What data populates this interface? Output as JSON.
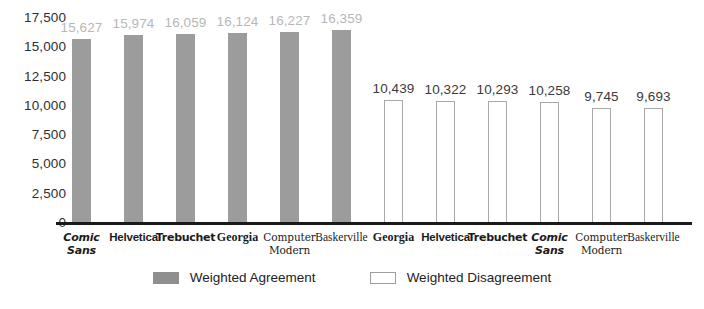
{
  "chart_data": {
    "type": "bar",
    "title": "",
    "subtitle": "",
    "xlabel": "",
    "ylabel": "",
    "ylim": [
      0,
      17500
    ],
    "ytick_step": 2500,
    "ytick_labels": [
      "17,500",
      "15,000",
      "12,500",
      "10,000",
      "7,500",
      "5,000",
      "2,500",
      "0"
    ],
    "ytick_values": [
      17500,
      15000,
      12500,
      10000,
      7500,
      5000,
      2500,
      0
    ],
    "grid": false,
    "legend_position": "bottom",
    "series": [
      {
        "name": "Weighted Agreement",
        "style": "solid",
        "color": "#9c9c9c",
        "label_color": "#b7b7b7",
        "categories": [
          "Comic Sans",
          "Helvetica",
          "Trebuchet",
          "Georgia",
          "Computer Modern",
          "Baskerville"
        ],
        "values": [
          15627,
          15974,
          16059,
          16124,
          16227,
          16359
        ],
        "value_labels": [
          "15,627",
          "15,974",
          "16,059",
          "16,124",
          "16,227",
          "16,359"
        ]
      },
      {
        "name": "Weighted Disagreement",
        "style": "hollow",
        "color": "#ffffff",
        "border_color": "#a8a8a8",
        "label_color": "#3a3a3a",
        "categories": [
          "Georgia",
          "Helvetica",
          "Trebuchet",
          "Comic Sans",
          "Computer Modern",
          "Baskerville"
        ],
        "values": [
          10439,
          10322,
          10293,
          10258,
          9745,
          9693
        ],
        "value_labels": [
          "10,439",
          "10,322",
          "10,293",
          "10,258",
          "9,745",
          "9,693"
        ]
      }
    ],
    "bars": [
      {
        "label": "Comic Sans",
        "label_lines": [
          "Comic",
          "Sans"
        ],
        "font_class": "f-comic",
        "value": 15627,
        "value_label": "15,627",
        "style": "solid"
      },
      {
        "label": "Helvetica",
        "label_lines": [
          "Helvetica"
        ],
        "font_class": "f-helvetica",
        "value": 15974,
        "value_label": "15,974",
        "style": "solid"
      },
      {
        "label": "Trebuchet",
        "label_lines": [
          "Trebuchet"
        ],
        "font_class": "f-trebuchet",
        "value": 16059,
        "value_label": "16,059",
        "style": "solid"
      },
      {
        "label": "Georgia",
        "label_lines": [
          "Georgia"
        ],
        "font_class": "f-georgia",
        "value": 16124,
        "value_label": "16,124",
        "style": "solid"
      },
      {
        "label": "Computer Modern",
        "label_lines": [
          "Computer",
          "Modern"
        ],
        "font_class": "f-cm",
        "value": 16227,
        "value_label": "16,227",
        "style": "solid"
      },
      {
        "label": "Baskerville",
        "label_lines": [
          "Baskerville"
        ],
        "font_class": "f-baskerville",
        "value": 16359,
        "value_label": "16,359",
        "style": "solid"
      },
      {
        "label": "Georgia",
        "label_lines": [
          "Georgia"
        ],
        "font_class": "f-georgia",
        "value": 10439,
        "value_label": "10,439",
        "style": "hollow"
      },
      {
        "label": "Helvetica",
        "label_lines": [
          "Helvetica"
        ],
        "font_class": "f-helvetica",
        "value": 10322,
        "value_label": "10,322",
        "style": "hollow"
      },
      {
        "label": "Trebuchet",
        "label_lines": [
          "Trebuchet"
        ],
        "font_class": "f-trebuchet",
        "value": 10293,
        "value_label": "10,293",
        "style": "hollow"
      },
      {
        "label": "Comic Sans",
        "label_lines": [
          "Comic",
          "Sans"
        ],
        "font_class": "f-comic",
        "value": 10258,
        "value_label": "10,258",
        "style": "hollow"
      },
      {
        "label": "Computer Modern",
        "label_lines": [
          "Computer",
          "Modern"
        ],
        "font_class": "f-cm",
        "value": 9745,
        "value_label": "9,745",
        "style": "hollow"
      },
      {
        "label": "Baskerville",
        "label_lines": [
          "Baskerville"
        ],
        "font_class": "f-baskerville",
        "value": 9693,
        "value_label": "9,693",
        "style": "hollow"
      }
    ]
  },
  "legend": {
    "items": [
      {
        "label": "Weighted Agreement",
        "style": "solid"
      },
      {
        "label": "Weighted Disagreement",
        "style": "hollow"
      }
    ]
  },
  "colors": {
    "bar_solid": "#9c9c9c",
    "bar_hollow_border": "#a8a8a8",
    "axis": "#1a1a1a",
    "text": "#1c1c1c",
    "label_light": "#b7b7b7",
    "label_dark": "#3a3a3a",
    "background": "#ffffff"
  }
}
